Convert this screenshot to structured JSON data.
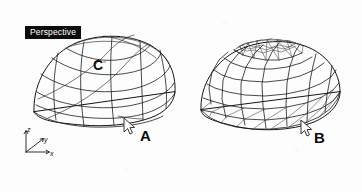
{
  "figure": {
    "background_color": "#fdfdfd",
    "line_color": "#1c1c1c",
    "viewport": {
      "label": "Perspective",
      "label_text_color": "#ffffff",
      "label_background_color": "#0d0d0d"
    },
    "axis_indicator": {
      "name": "world-axis-gizmo",
      "z_label": "z",
      "y_label": "y",
      "x_label": "x"
    },
    "callouts": [
      {
        "id": "a",
        "label": "A",
        "note": "cursor on edge of NURBS surface"
      },
      {
        "id": "b",
        "label": "B",
        "note": "cursor on edge of polygon mesh"
      },
      {
        "id": "c",
        "label": "C",
        "mark": "▫",
        "note": "control point on surface"
      }
    ],
    "objects": [
      {
        "name": "nurbs-surface-dome",
        "side": "left",
        "type": "smooth curved surface with isoparm grid"
      },
      {
        "name": "polygon-mesh-dome",
        "side": "right",
        "type": "faceted polygon mesh dome with triangulated cap and base"
      }
    ],
    "cursors": [
      {
        "name": "cursor-a"
      },
      {
        "name": "cursor-b"
      }
    ]
  }
}
